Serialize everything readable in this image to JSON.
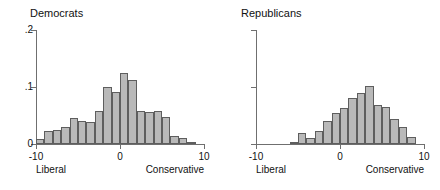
{
  "chart_data": {
    "type": "bar",
    "title": "",
    "layout": "two side-by-side histogram panels",
    "xlabel": "",
    "ylabel": "",
    "xlim": [
      -10,
      10
    ],
    "ylim": [
      0,
      0.2
    ],
    "yticks": [
      0,
      0.1,
      0.2
    ],
    "ytick_labels": [
      "0",
      ".1",
      ".2"
    ],
    "xticks": [
      -10,
      0,
      10
    ],
    "xtick_labels": [
      "-10",
      "0",
      "10"
    ],
    "grid": false,
    "legend": "none",
    "bin_width": 1,
    "axis_end_labels": {
      "left": "Liberal",
      "right": "Conservative"
    },
    "panels": [
      {
        "title": "Democrats",
        "bin_centers": [
          -9.5,
          -8.5,
          -7.5,
          -6.5,
          -5.5,
          -4.5,
          -3.5,
          -2.5,
          -1.5,
          -0.5,
          0.5,
          1.5,
          2.5,
          3.5,
          4.5,
          5.5,
          6.5,
          7.5,
          8.5
        ],
        "values": [
          0.008,
          0.022,
          0.025,
          0.03,
          0.045,
          0.041,
          0.039,
          0.058,
          0.1,
          0.091,
          0.125,
          0.112,
          0.058,
          0.057,
          0.058,
          0.047,
          0.014,
          0.01,
          0.004
        ]
      },
      {
        "title": "Republicans",
        "bin_centers": [
          -5.5,
          -4.5,
          -3.5,
          -2.5,
          -1.5,
          -0.5,
          0.5,
          1.5,
          2.5,
          3.5,
          4.5,
          5.5,
          6.5,
          7.5,
          8.5
        ],
        "values": [
          0.004,
          0.019,
          0.01,
          0.023,
          0.04,
          0.054,
          0.064,
          0.08,
          0.09,
          0.102,
          0.068,
          0.065,
          0.044,
          0.03,
          0.013
        ]
      }
    ]
  },
  "style": {
    "bar_fill": "#b9b9b9",
    "bar_stroke": "#5e5e5e",
    "axis_color": "#6f6f6f",
    "text_color": "#111111",
    "background": "#ffffff"
  }
}
